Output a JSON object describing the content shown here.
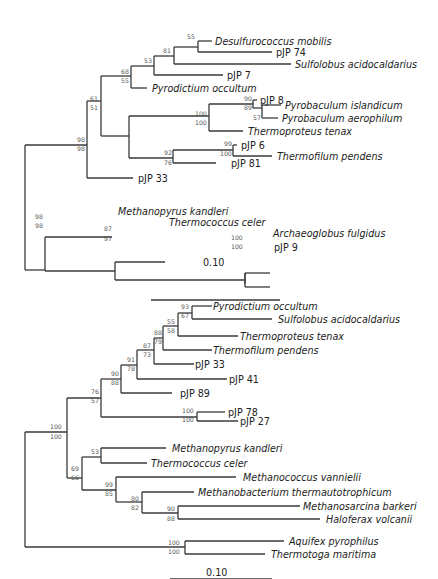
{
  "trees": [
    {
      "id": "tree-top",
      "taxa": [
        {
          "name": "Desulfurococcus mobilis",
          "italic": true
        },
        {
          "name": "pJP 74",
          "italic": false
        },
        {
          "name": "Sulfolobus acidocaldarius",
          "italic": true
        },
        {
          "name": "pJP 7",
          "italic": false
        },
        {
          "name": "Pyrodictium occultum",
          "italic": true
        },
        {
          "name": "pJP 8",
          "italic": false
        },
        {
          "name": "Pyrobaculum islandicum",
          "italic": true
        },
        {
          "name": "Pyrobaculum aerophilum",
          "italic": true
        },
        {
          "name": "Thermoproteus tenax",
          "italic": true
        },
        {
          "name": "pJP 6",
          "italic": false
        },
        {
          "name": "Thermofilum pendens",
          "italic": true
        },
        {
          "name": "pJP 81",
          "italic": false
        },
        {
          "name": "pJP 33",
          "italic": false
        },
        {
          "name": "Methanopyrus kandleri",
          "italic": true
        },
        {
          "name": "Thermococcus celer",
          "italic": true
        },
        {
          "name": "Archaeoglobus fulgidus",
          "italic": true
        },
        {
          "name": "pJP 9",
          "italic": false
        }
      ],
      "bootstrap": [
        {
          "top": "55",
          "bottom": ""
        },
        {
          "top": "81",
          "bottom": ""
        },
        {
          "top": "53",
          "bottom": ""
        },
        {
          "top": "68",
          "bottom": "55"
        },
        {
          "top": "61",
          "bottom": "51"
        },
        {
          "top": "90",
          "bottom": "89"
        },
        {
          "top": "",
          "bottom": "57"
        },
        {
          "top": "100",
          "bottom": "100"
        },
        {
          "top": "99",
          "bottom": "100"
        },
        {
          "top": "92",
          "bottom": "76"
        },
        {
          "top": "98",
          "bottom": "98"
        },
        {
          "top": "98",
          "bottom": "98"
        },
        {
          "top": "87",
          "bottom": "97"
        },
        {
          "top": "100",
          "bottom": "100"
        }
      ],
      "scale_bar": "0.10"
    },
    {
      "id": "tree-bottom",
      "taxa": [
        {
          "name": "Pyrodictium occultum",
          "italic": true
        },
        {
          "name": "Sulfolobus acidocaldarius",
          "italic": true
        },
        {
          "name": "Thermoproteus tenax",
          "italic": true
        },
        {
          "name": "Thermofilum pendens",
          "italic": true
        },
        {
          "name": "pJP 33",
          "italic": false
        },
        {
          "name": "pJP 41",
          "italic": false
        },
        {
          "name": "pJP 89",
          "italic": false
        },
        {
          "name": "pJP 78",
          "italic": false
        },
        {
          "name": "pJP 27",
          "italic": false
        },
        {
          "name": "Methanopyrus kandleri",
          "italic": true
        },
        {
          "name": "Thermococcus celer",
          "italic": true
        },
        {
          "name": "Methanococcus vannielii",
          "italic": true
        },
        {
          "name": "Methanobacterium thermautotrophicum",
          "italic": true
        },
        {
          "name": "Methanosarcina barkeri",
          "italic": true
        },
        {
          "name": "Haloferax volcanii",
          "italic": true
        },
        {
          "name": "Aquifex pyrophilus",
          "italic": true
        },
        {
          "name": "Thermotoga maritima",
          "italic": true
        }
      ],
      "bootstrap": [
        {
          "top": "93",
          "bottom": "67"
        },
        {
          "top": "55",
          "bottom": "58"
        },
        {
          "top": "88",
          "bottom": "79"
        },
        {
          "top": "87",
          "bottom": "73"
        },
        {
          "top": "91",
          "bottom": "78"
        },
        {
          "top": "90",
          "bottom": "88"
        },
        {
          "top": "76",
          "bottom": "57"
        },
        {
          "top": "100",
          "bottom": "100"
        },
        {
          "top": "100",
          "bottom": "100"
        },
        {
          "top": "53",
          "bottom": ""
        },
        {
          "top": "69",
          "bottom": "66"
        },
        {
          "top": "99",
          "bottom": "85"
        },
        {
          "top": "80",
          "bottom": "82"
        },
        {
          "top": "90",
          "bottom": "88"
        },
        {
          "top": "100",
          "bottom": "100"
        }
      ],
      "scale_bar": "0.10"
    }
  ]
}
